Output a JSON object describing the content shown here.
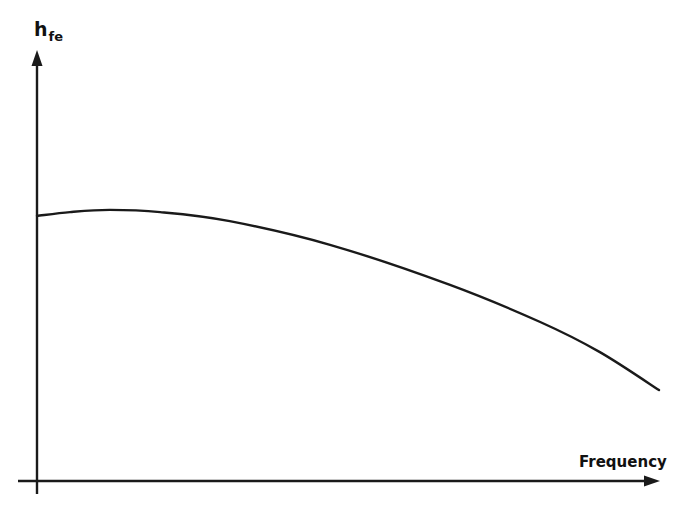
{
  "chart_data": {
    "type": "line",
    "title": "",
    "xlabel": "Frequency",
    "ylabel": "h_fe",
    "ylabel_main": "h",
    "ylabel_subscript": "fe",
    "x_ticks": [],
    "y_ticks": [],
    "grid": false,
    "legend": null,
    "axis_style": "arrows",
    "xlim": [
      0,
      100
    ],
    "ylim": [
      0,
      100
    ],
    "units_note": "Qualitative sketch; no numeric ticks. Values normalized 0-100 along each axis.",
    "series": [
      {
        "name": "h_fe vs frequency",
        "color": "#1a1a1a",
        "x": [
          0,
          5.3,
          11.7,
          19.8,
          31.0,
          47.1,
          66.4,
          80.9,
          90.5,
          100
        ],
        "y": [
          61.5,
          62.4,
          62.9,
          62.4,
          60.3,
          54.8,
          45.5,
          36.9,
          29.9,
          21.1
        ]
      }
    ]
  },
  "colors": {
    "ink": "#1a1a1a",
    "background": "#ffffff"
  }
}
